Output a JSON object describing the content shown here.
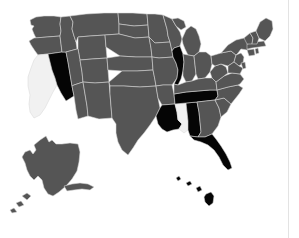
{
  "map": {
    "title": "United States choropleth map",
    "region_label": "United States",
    "projection": "albers-usa",
    "background_color": "#ffffff",
    "divider_color": "#e3e3e3",
    "border_color": "#d8d8d8",
    "legend": {
      "visible": false,
      "categories": [
        {
          "key": "highlighted",
          "label": "Highlighted",
          "color": "#050505"
        },
        {
          "key": "base",
          "label": "Base",
          "color": "#555555"
        },
        {
          "key": "unfilled",
          "label": "No data",
          "color": "#f1f1f1"
        }
      ]
    },
    "counts": {
      "highlighted": 7,
      "unfilled": 2
    },
    "highlighted_states": [
      "Nevada",
      "Illinois",
      "Tennessee",
      "Louisiana",
      "Alabama",
      "Florida",
      "Hawaii"
    ],
    "unfilled_states": [
      "California",
      "Mississippi"
    ],
    "states": [
      {
        "id": "AK",
        "name": "Alaska",
        "status": "base",
        "color": "#555555"
      },
      {
        "id": "AL",
        "name": "Alabama",
        "status": "highlighted",
        "color": "#050505"
      },
      {
        "id": "AR",
        "name": "Arkansas",
        "status": "base",
        "color": "#555555"
      },
      {
        "id": "AZ",
        "name": "Arizona",
        "status": "base",
        "color": "#555555"
      },
      {
        "id": "CA",
        "name": "California",
        "status": "unfilled",
        "color": "#f1f1f1"
      },
      {
        "id": "CO",
        "name": "Colorado",
        "status": "base",
        "color": "#555555"
      },
      {
        "id": "CT",
        "name": "Connecticut",
        "status": "base",
        "color": "#555555"
      },
      {
        "id": "DE",
        "name": "Delaware",
        "status": "base",
        "color": "#555555"
      },
      {
        "id": "FL",
        "name": "Florida",
        "status": "highlighted",
        "color": "#050505"
      },
      {
        "id": "GA",
        "name": "Georgia",
        "status": "base",
        "color": "#555555"
      },
      {
        "id": "HI",
        "name": "Hawaii",
        "status": "highlighted",
        "color": "#050505"
      },
      {
        "id": "IA",
        "name": "Iowa",
        "status": "base",
        "color": "#555555"
      },
      {
        "id": "ID",
        "name": "Idaho",
        "status": "base",
        "color": "#555555"
      },
      {
        "id": "IL",
        "name": "Illinois",
        "status": "highlighted",
        "color": "#050505"
      },
      {
        "id": "IN",
        "name": "Indiana",
        "status": "base",
        "color": "#555555"
      },
      {
        "id": "KS",
        "name": "Kansas",
        "status": "base",
        "color": "#555555"
      },
      {
        "id": "KY",
        "name": "Kentucky",
        "status": "base",
        "color": "#555555"
      },
      {
        "id": "LA",
        "name": "Louisiana",
        "status": "highlighted",
        "color": "#050505"
      },
      {
        "id": "MA",
        "name": "Massachusetts",
        "status": "base",
        "color": "#555555"
      },
      {
        "id": "MD",
        "name": "Maryland",
        "status": "base",
        "color": "#555555"
      },
      {
        "id": "ME",
        "name": "Maine",
        "status": "base",
        "color": "#555555"
      },
      {
        "id": "MI",
        "name": "Michigan",
        "status": "base",
        "color": "#555555"
      },
      {
        "id": "MN",
        "name": "Minnesota",
        "status": "base",
        "color": "#555555"
      },
      {
        "id": "MO",
        "name": "Missouri",
        "status": "base",
        "color": "#555555"
      },
      {
        "id": "MS",
        "name": "Mississippi",
        "status": "unfilled",
        "color": "#f1f1f1"
      },
      {
        "id": "MT",
        "name": "Montana",
        "status": "base",
        "color": "#555555"
      },
      {
        "id": "NC",
        "name": "North Carolina",
        "status": "base",
        "color": "#555555"
      },
      {
        "id": "ND",
        "name": "North Dakota",
        "status": "base",
        "color": "#555555"
      },
      {
        "id": "NE",
        "name": "Nebraska",
        "status": "base",
        "color": "#555555"
      },
      {
        "id": "NH",
        "name": "New Hampshire",
        "status": "base",
        "color": "#555555"
      },
      {
        "id": "NJ",
        "name": "New Jersey",
        "status": "base",
        "color": "#555555"
      },
      {
        "id": "NM",
        "name": "New Mexico",
        "status": "base",
        "color": "#555555"
      },
      {
        "id": "NV",
        "name": "Nevada",
        "status": "highlighted",
        "color": "#050505"
      },
      {
        "id": "NY",
        "name": "New York",
        "status": "base",
        "color": "#555555"
      },
      {
        "id": "OH",
        "name": "Ohio",
        "status": "base",
        "color": "#555555"
      },
      {
        "id": "OK",
        "name": "Oklahoma",
        "status": "base",
        "color": "#555555"
      },
      {
        "id": "OR",
        "name": "Oregon",
        "status": "base",
        "color": "#555555"
      },
      {
        "id": "PA",
        "name": "Pennsylvania",
        "status": "base",
        "color": "#555555"
      },
      {
        "id": "RI",
        "name": "Rhode Island",
        "status": "base",
        "color": "#555555"
      },
      {
        "id": "SC",
        "name": "South Carolina",
        "status": "base",
        "color": "#555555"
      },
      {
        "id": "SD",
        "name": "South Dakota",
        "status": "base",
        "color": "#555555"
      },
      {
        "id": "TN",
        "name": "Tennessee",
        "status": "highlighted",
        "color": "#050505"
      },
      {
        "id": "TX",
        "name": "Texas",
        "status": "base",
        "color": "#555555"
      },
      {
        "id": "UT",
        "name": "Utah",
        "status": "base",
        "color": "#555555"
      },
      {
        "id": "VA",
        "name": "Virginia",
        "status": "base",
        "color": "#555555"
      },
      {
        "id": "VT",
        "name": "Vermont",
        "status": "base",
        "color": "#555555"
      },
      {
        "id": "WA",
        "name": "Washington",
        "status": "base",
        "color": "#555555"
      },
      {
        "id": "WI",
        "name": "Wisconsin",
        "status": "base",
        "color": "#555555"
      },
      {
        "id": "WV",
        "name": "West Virginia",
        "status": "base",
        "color": "#555555"
      },
      {
        "id": "WY",
        "name": "Wyoming",
        "status": "base",
        "color": "#555555"
      }
    ]
  }
}
